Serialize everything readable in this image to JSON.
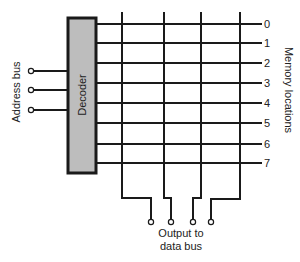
{
  "diagram": {
    "decoder": {
      "label": "Decoder",
      "fill": "#bdbdbd",
      "border": "#1a1a1a",
      "x": 68,
      "y": 18,
      "width": 28,
      "height": 155
    },
    "address_bus": {
      "label": "Address bus",
      "inputs": [
        {
          "y": 71
        },
        {
          "y": 90
        },
        {
          "y": 110
        }
      ],
      "terminal_x": 31
    },
    "memory_locations": {
      "label": "Memory locations",
      "rows": [
        {
          "label": "0",
          "y": 24
        },
        {
          "label": "1",
          "y": 43
        },
        {
          "label": "2",
          "y": 63
        },
        {
          "label": "3",
          "y": 83
        },
        {
          "label": "4",
          "y": 103
        },
        {
          "label": "5",
          "y": 123
        },
        {
          "label": "6",
          "y": 144
        },
        {
          "label": "7",
          "y": 163
        }
      ],
      "row_end_x": 262
    },
    "bit_lines": [
      {
        "x": 122,
        "bend_y": 198,
        "out_x": 151
      },
      {
        "x": 164,
        "bend_y": 198,
        "out_x": 171
      },
      {
        "x": 201,
        "bend_y": 198,
        "out_x": 193
      },
      {
        "x": 240,
        "bend_y": 199,
        "out_x": 211
      }
    ],
    "output": {
      "line1": "Output to",
      "line2": "data bus",
      "terminal_y": 222
    },
    "colors": {
      "line": "#1a1a1a",
      "decoder_fill": "#bdbdbd",
      "background": "#ffffff"
    }
  }
}
